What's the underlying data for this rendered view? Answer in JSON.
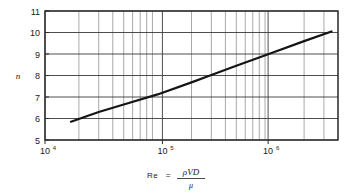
{
  "chart_data": {
    "type": "line",
    "title": "",
    "subtitle": "",
    "xlabel": "Re = ρVD/μ",
    "xlabel_parts": {
      "symbol": "Re",
      "equals": "=",
      "numerator": "ρVD",
      "denominator": "μ"
    },
    "ylabel": "n",
    "xscale": "log",
    "yscale": "linear",
    "xlim": [
      10000,
      4000000
    ],
    "ylim": [
      5,
      11
    ],
    "grid": true,
    "grid_style": "log-minor-and-major",
    "legend": "none",
    "x_major_ticks": [
      10000,
      100000,
      1000000
    ],
    "x_major_tick_labels": [
      "10⁴",
      "10⁵",
      "10⁶"
    ],
    "x_major_tick_mantissa": [
      "10",
      "10",
      "10"
    ],
    "x_major_tick_exponent": [
      "4",
      "5",
      "6"
    ],
    "x_minor_ticks": [
      20000,
      30000,
      40000,
      50000,
      60000,
      70000,
      80000,
      90000,
      200000,
      300000,
      400000,
      500000,
      600000,
      700000,
      800000,
      900000,
      2000000,
      3000000,
      4000000
    ],
    "y_ticks": [
      5,
      6,
      7,
      8,
      9,
      10,
      11
    ],
    "y_tick_labels": [
      "5",
      "6",
      "7",
      "8",
      "9",
      "10",
      "11"
    ],
    "series": [
      {
        "name": "n vs Re",
        "color": "#151515",
        "linewidth": 2.2,
        "x": [
          17000,
          30000,
          50000,
          100000,
          200000,
          300000,
          500000,
          1000000,
          2000000,
          3500000
        ],
        "y": [
          5.85,
          6.3,
          6.65,
          7.12,
          7.68,
          8.02,
          8.45,
          9.02,
          9.6,
          10.05
        ]
      }
    ],
    "colors": {
      "axis": "#2b2b2b",
      "grid_major": "#3a3a3a",
      "grid_minor": "#6e6e6e",
      "line": "#151515",
      "background": "#ffffff",
      "text": "#1a1a1a"
    }
  }
}
